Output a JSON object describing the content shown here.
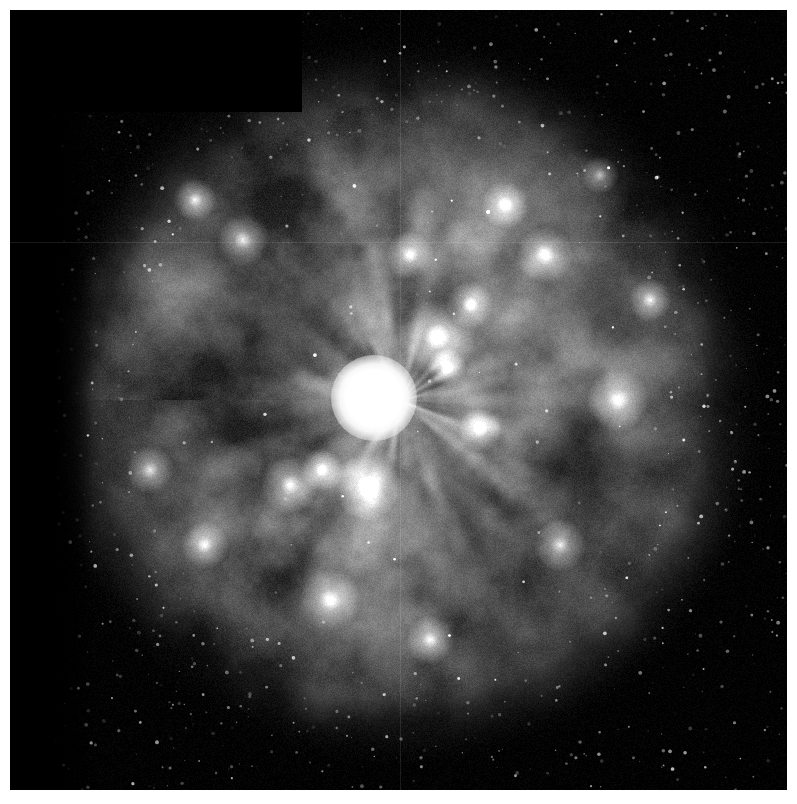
{
  "image": {
    "kind": "astronomical-photograph",
    "subject": "emission nebula with central bright star",
    "instrument_style": "space-telescope wide-field mosaic",
    "color_mode": "grayscale",
    "canvas_width": 797,
    "canvas_height": 804,
    "margin": {
      "left": 10,
      "top": 10,
      "right": 10,
      "bottom": 14
    },
    "plate": {
      "x": 10,
      "y": 10,
      "width": 777,
      "height": 780
    },
    "background_color": "#000000",
    "page_color": "#ffffff",
    "has_caption_text": false,
    "has_overlay_labels": false,
    "has_scale_bar": false,
    "has_compass_rose": false
  },
  "chart_data": {
    "type": "heatmap",
    "title": "",
    "xlabel": "",
    "ylabel": "",
    "grid": false,
    "legend": "none",
    "colormap": "grayscale",
    "value_range": [
      0,
      255
    ],
    "structures": [
      {
        "name": "nebula-core",
        "center_x": 400,
        "center_y": 400,
        "radius": 300,
        "peak_brightness": 205
      },
      {
        "name": "nebula-halo",
        "center_x": 400,
        "center_y": 400,
        "radius": 372,
        "peak_brightness": 70
      },
      {
        "name": "central-star",
        "center_x": 374,
        "center_y": 398,
        "radius": 17,
        "peak_brightness": 255
      },
      {
        "name": "dark-lane-left",
        "center_x": 250,
        "center_y": 340,
        "radius": 95,
        "peak_brightness": 28
      },
      {
        "name": "dark-lane-right",
        "center_x": 590,
        "center_y": 470,
        "radius": 80,
        "peak_brightness": 32
      },
      {
        "name": "dark-lane-upper",
        "center_x": 455,
        "center_y": 310,
        "radius": 60,
        "peak_brightness": 40
      },
      {
        "name": "sky-background",
        "center_x": 700,
        "center_y": 120,
        "radius": 120,
        "peak_brightness": 6
      }
    ],
    "bright_knots": [
      {
        "x": 437,
        "y": 337,
        "r": 16,
        "i": 230
      },
      {
        "x": 470,
        "y": 305,
        "r": 10,
        "i": 215
      },
      {
        "x": 447,
        "y": 367,
        "r": 8,
        "i": 210
      },
      {
        "x": 368,
        "y": 487,
        "r": 14,
        "i": 225
      },
      {
        "x": 290,
        "y": 485,
        "r": 12,
        "i": 205
      },
      {
        "x": 322,
        "y": 470,
        "r": 9,
        "i": 200
      },
      {
        "x": 545,
        "y": 255,
        "r": 12,
        "i": 200
      },
      {
        "x": 505,
        "y": 205,
        "r": 10,
        "i": 195
      },
      {
        "x": 618,
        "y": 400,
        "r": 13,
        "i": 196
      },
      {
        "x": 243,
        "y": 240,
        "r": 11,
        "i": 190
      },
      {
        "x": 195,
        "y": 200,
        "r": 9,
        "i": 180
      },
      {
        "x": 410,
        "y": 255,
        "r": 10,
        "i": 198
      },
      {
        "x": 560,
        "y": 545,
        "r": 11,
        "i": 190
      },
      {
        "x": 330,
        "y": 600,
        "r": 13,
        "i": 196
      },
      {
        "x": 430,
        "y": 640,
        "r": 10,
        "i": 178
      },
      {
        "x": 150,
        "y": 470,
        "r": 10,
        "i": 172
      },
      {
        "x": 650,
        "y": 300,
        "r": 9,
        "i": 176
      },
      {
        "x": 205,
        "y": 545,
        "r": 10,
        "i": 170
      },
      {
        "x": 480,
        "y": 430,
        "r": 9,
        "i": 188
      },
      {
        "x": 600,
        "y": 175,
        "r": 8,
        "i": 150
      }
    ],
    "chip_notches": [
      {
        "name": "upper-left-chip-gap",
        "x": 0,
        "y": 0,
        "width": 292,
        "height": 102
      },
      {
        "name": "left-margin-chip-gap",
        "x": 0,
        "y": 0,
        "width": 83,
        "height": 780
      }
    ],
    "detector_seams": [
      {
        "name": "horizontal-seam",
        "orientation": "horizontal",
        "position": 232
      },
      {
        "name": "vertical-seam",
        "orientation": "vertical",
        "position": 390
      }
    ],
    "star_field": {
      "count": 1400,
      "max_radius": 1.6,
      "brightness_range": [
        40,
        210
      ]
    }
  },
  "central_star": {
    "label": "central-star",
    "x": 374,
    "y": 398,
    "diameter": 34,
    "glow_diameter": 86,
    "color": "#ffffff",
    "spike_count": 4,
    "spike_length": 52,
    "spike_angles": [
      10,
      75,
      145,
      215
    ]
  },
  "rendering": {
    "noise_seed": 20240517,
    "filament_count": 46,
    "clump_count": 210,
    "halo_clump_count": 120
  }
}
